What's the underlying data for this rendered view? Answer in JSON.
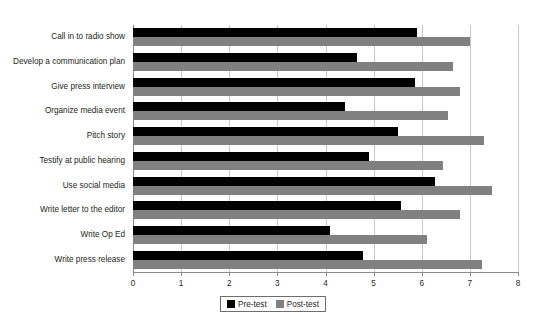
{
  "chart_data": {
    "type": "bar",
    "orientation": "horizontal",
    "title": "",
    "subtitle": "",
    "xlabel": "",
    "ylabel": "",
    "xlim": [
      0,
      8
    ],
    "xticks": [
      0,
      1,
      2,
      3,
      4,
      5,
      6,
      7,
      8
    ],
    "xtick_labels": [
      "0",
      "1",
      "2",
      "3",
      "4",
      "5",
      "6",
      "7",
      "8"
    ],
    "grid": true,
    "grid_axis": "x",
    "legend_position": "bottom-center",
    "categories": [
      "Call in to radio show",
      "Develop a communication plan",
      "Give press interview",
      "Organize media event",
      "Pitch story",
      "Testify at public hearing",
      "Use social media",
      "Write letter to the editor",
      "Write Op Ed",
      "Write press release"
    ],
    "series": [
      {
        "name": "Pre-test",
        "color": "#000000",
        "values": [
          5.9,
          4.65,
          5.85,
          4.4,
          5.5,
          4.9,
          6.27,
          5.56,
          4.1,
          4.77
        ]
      },
      {
        "name": "Post-test",
        "color": "#808080",
        "values": [
          7.0,
          6.65,
          6.8,
          6.55,
          7.3,
          6.45,
          7.45,
          6.8,
          6.1,
          7.25
        ]
      }
    ],
    "annotations": []
  },
  "legend": {
    "entries": [
      {
        "label": "Pre-test",
        "swatch": "black-square-swatch"
      },
      {
        "label": "Post-test",
        "swatch": "gray-square-swatch"
      }
    ]
  }
}
